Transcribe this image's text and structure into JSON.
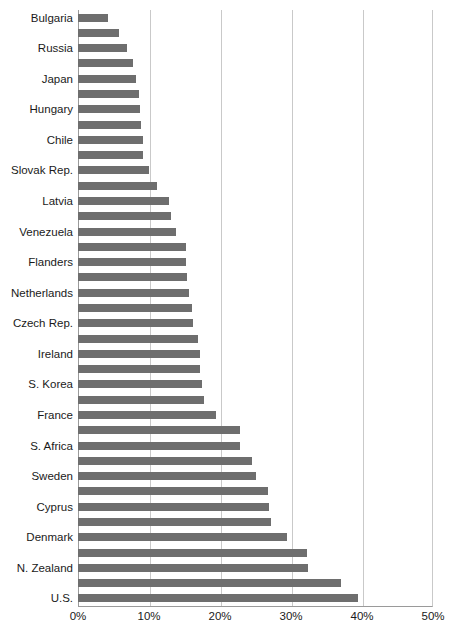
{
  "chart_data": {
    "type": "bar",
    "orientation": "horizontal",
    "title": "",
    "subtitle": "",
    "xlabel": "",
    "ylabel": "",
    "xlim": [
      0,
      50
    ],
    "xtick_labels": [
      "0%",
      "10%",
      "20%",
      "30%",
      "40%",
      "50%"
    ],
    "xtick_values": [
      0,
      10,
      20,
      30,
      40,
      50
    ],
    "grid": true,
    "grid_axis": "x",
    "legend": null,
    "bar_color": "#6e6e6e",
    "axis_color": "#9a9a9a",
    "gridline_color": "#c9c9c9",
    "background_color": "#ffffff",
    "note": "Category labels are shown on every other bar; unlabeled bars have no visible tick text.",
    "categories": [
      "Bulgaria",
      "",
      "Russia",
      "",
      "Japan",
      "",
      "Hungary",
      "",
      "Chile",
      "",
      "Slovak Rep.",
      "",
      "Latvia",
      "",
      "Venezuela",
      "",
      "Flanders",
      "",
      "Netherlands",
      "",
      "Czech Rep.",
      "",
      "Ireland",
      "",
      "S. Korea",
      "",
      "France",
      "",
      "S. Africa",
      "",
      "Sweden",
      "",
      "Cyprus",
      "",
      "Denmark",
      "",
      "N. Zealand",
      "",
      "U.S.",
      ""
    ],
    "values": [
      4.2,
      5.8,
      6.9,
      7.7,
      8.2,
      8.6,
      8.7,
      8.9,
      9.2,
      9.2,
      10.0,
      11.1,
      12.8,
      13.1,
      13.8,
      15.2,
      15.2,
      15.4,
      15.6,
      16.0,
      16.2,
      16.9,
      17.2,
      17.2,
      17.5,
      17.8,
      19.4,
      22.8,
      22.8,
      24.5,
      25.1,
      26.8,
      26.9,
      27.2,
      29.4,
      32.2,
      32.4,
      37.1,
      39.4,
      0
    ],
    "bar_count": 39
  }
}
